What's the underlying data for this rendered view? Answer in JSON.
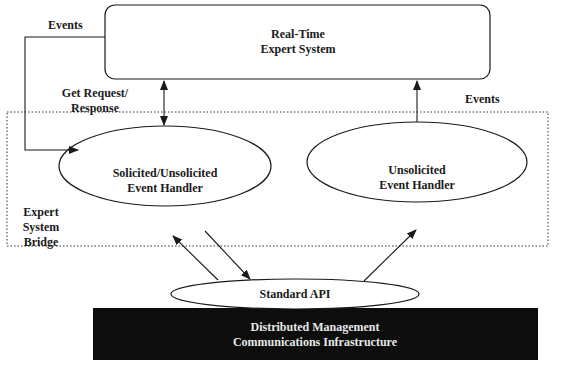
{
  "diagram": {
    "nodes": {
      "expert_system": {
        "line1": "Real-Time",
        "line2": "Expert System"
      },
      "solicited_handler": {
        "line1": "Solicited/Unsolicited",
        "line2": "Event Handler"
      },
      "unsolicited_handler": {
        "line1": "Unsolicited",
        "line2": "Event Handler"
      },
      "standard_api": {
        "label": "Standard API"
      },
      "infrastructure": {
        "line1": "Distributed Management",
        "line2": "Communications Infrastructure"
      }
    },
    "group": {
      "line1": "Expert",
      "line2": "System",
      "line3": "Bridge"
    },
    "edges": {
      "events_left": "Events",
      "get_request_line1": "Get Request/",
      "get_request_line2": "Response",
      "events_right": "Events"
    },
    "colors": {
      "stroke": "#1a1a1a",
      "infrastructure_fill": "#0d0d0d",
      "infrastructure_text": "#e8e8e8"
    }
  }
}
